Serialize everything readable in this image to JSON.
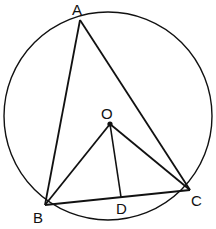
{
  "diagram": {
    "type": "circle-geometry",
    "circle": {
      "cx": 108,
      "cy": 116,
      "r": 104
    },
    "points": {
      "A": {
        "label": "A",
        "x": 80,
        "y": 20
      },
      "B": {
        "label": "B",
        "x": 45,
        "y": 205
      },
      "C": {
        "label": "C",
        "x": 190,
        "y": 190
      },
      "O": {
        "label": "O",
        "x": 110,
        "y": 124
      },
      "D": {
        "label": "D",
        "x": 121,
        "y": 197
      }
    },
    "segments": [
      "AB",
      "AC",
      "BC",
      "OB",
      "OC",
      "OD"
    ],
    "labels": {
      "A": "A",
      "B": "B",
      "C": "C",
      "O": "O",
      "D": "D"
    },
    "stroke_color": "#111111"
  }
}
